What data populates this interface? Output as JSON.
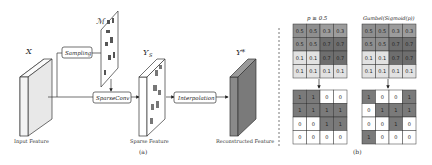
{
  "part_a": {
    "caption": "(a)",
    "input": {
      "symbol": "X",
      "label": "Input Feature"
    },
    "mask": {
      "symbol": "ℳ"
    },
    "sampling_box": "Sampling",
    "sparseconv_box": "SparseConv",
    "sparse": {
      "symbol": "Y",
      "subscript": "S",
      "label": "Sparse Feature"
    },
    "interp_box": "Interpolation",
    "recon": {
      "symbol": "Y*",
      "label": "Reconstructed Feature"
    }
  },
  "part_b": {
    "caption": "(b)",
    "left": {
      "title": "p ≥ 0.5",
      "probs": [
        [
          "0.5",
          "0.5",
          "0.3",
          "0.3"
        ],
        [
          "0.5",
          "0.5",
          "0.7",
          "0.7"
        ],
        [
          "0.1",
          "0.1",
          "0.7",
          "0.7"
        ],
        [
          "0.1",
          "0.1",
          "0.1",
          "0.1"
        ]
      ],
      "binary": [
        [
          "1",
          "1",
          "0",
          "0"
        ],
        [
          "1",
          "1",
          "1",
          "1"
        ],
        [
          "0",
          "0",
          "1",
          "1"
        ],
        [
          "0",
          "0",
          "0",
          "0"
        ]
      ]
    },
    "right": {
      "title": "Gumbel(Sigmoid(p))",
      "probs": [
        [
          "0.5",
          "0.5",
          "0.3",
          "0.3"
        ],
        [
          "0.5",
          "0.5",
          "0.7",
          "0.7"
        ],
        [
          "0.1",
          "0.1",
          "0.7",
          "0.7"
        ],
        [
          "0.1",
          "0.1",
          "0.1",
          "0.1"
        ]
      ],
      "binary": [
        [
          "1",
          "0",
          "0",
          "1"
        ],
        [
          "0",
          "1",
          "1",
          "1"
        ],
        [
          "0",
          "0",
          "1",
          "0"
        ],
        [
          "1",
          "0",
          "0",
          "0"
        ]
      ]
    }
  },
  "colors": {
    "p05": "#8f8f8f",
    "p03": "#9c9c9c",
    "p07": "#6e6e6e",
    "p01": "#e2e2e2",
    "one": "#7a7a7a",
    "zero": "#ffffff",
    "recon_face": "#8a8a8a",
    "recon_side": "#6f6f6f"
  }
}
